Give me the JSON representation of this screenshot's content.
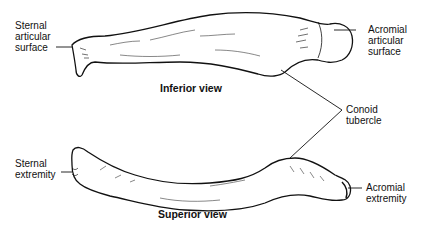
{
  "diagram": {
    "views": {
      "inferior": "Inferior view",
      "superior": "Superior view"
    },
    "labels": {
      "sternal_articular_surface": [
        "Sternal",
        "articular",
        "surface"
      ],
      "acromial_articular_surface": [
        "Acromial",
        "articular",
        "surface"
      ],
      "conoid_tubercle": [
        "Conoid",
        "tubercle"
      ],
      "sternal_extremity": [
        "Sternal",
        "extremity"
      ],
      "acromial_extremity": [
        "Acromial",
        "extremity"
      ]
    },
    "colors": {
      "ink": "#111111",
      "background": "#ffffff"
    }
  }
}
